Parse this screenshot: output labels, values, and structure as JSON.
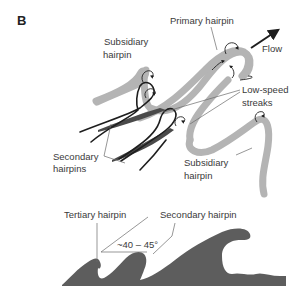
{
  "figure": {
    "panel_label": "B",
    "top_diagram": {
      "labels": {
        "primary_hairpin": "Primary hairpin",
        "flow": "Flow",
        "subsidiary_hairpin_top_line1": "Subsidiary",
        "subsidiary_hairpin_top_line2": "hairpin",
        "low_speed_streaks_line1": "Low-speed",
        "low_speed_streaks_line2": "streaks",
        "secondary_hairpins_line1": "Secondary",
        "secondary_hairpins_line2": "hairpins",
        "subsidiary_hairpin_bottom_line1": "Subsidiary",
        "subsidiary_hairpin_bottom_line2": "hairpin"
      },
      "icons": [
        "flow-arrow-icon",
        "rotation-arrow-icon"
      ]
    },
    "bottom_diagram": {
      "labels": {
        "tertiary_hairpin": "Tertiary hairpin",
        "secondary_hairpin": "Secondary hairpin",
        "angle": "~40 – 45°"
      }
    },
    "colors": {
      "vortex_tube": "#b4b4b4",
      "hairpin_line": "#1e1e1e",
      "streak": "#4a4a4a",
      "wave_fill": "#5d5d5d",
      "text": "#3a3a3a"
    }
  }
}
